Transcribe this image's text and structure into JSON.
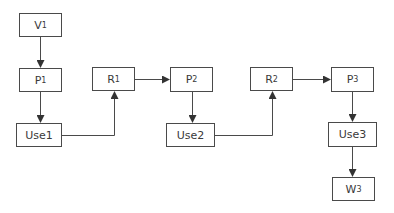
{
  "diagram": {
    "type": "flowchart",
    "colors": {
      "stroke": "#4a4a4a",
      "text": "#3a3a3a",
      "background": "#ffffff"
    },
    "nodes": [
      {
        "id": "V1",
        "base": "V",
        "sub": "1",
        "x": 19,
        "y": 13,
        "w": 43,
        "h": 24
      },
      {
        "id": "P1",
        "base": "P",
        "sub": "1",
        "x": 19,
        "y": 68,
        "w": 43,
        "h": 24
      },
      {
        "id": "Use1",
        "base": "Use1",
        "sub": "",
        "x": 16,
        "y": 123,
        "w": 46,
        "h": 24
      },
      {
        "id": "R1",
        "base": "R",
        "sub": "1",
        "x": 92,
        "y": 67,
        "w": 43,
        "h": 24
      },
      {
        "id": "P2",
        "base": "P",
        "sub": "2",
        "x": 170,
        "y": 67,
        "w": 43,
        "h": 25
      },
      {
        "id": "Use2",
        "base": "Use2",
        "sub": "",
        "x": 166,
        "y": 123,
        "w": 49,
        "h": 24
      },
      {
        "id": "R2",
        "base": "R",
        "sub": "2",
        "x": 250,
        "y": 67,
        "w": 43,
        "h": 24
      },
      {
        "id": "P3",
        "base": "P",
        "sub": "3",
        "x": 331,
        "y": 67,
        "w": 43,
        "h": 25
      },
      {
        "id": "Use3",
        "base": "Use3",
        "sub": "",
        "x": 328,
        "y": 122,
        "w": 49,
        "h": 25
      },
      {
        "id": "W3",
        "base": "W",
        "sub": "3",
        "x": 332,
        "y": 177,
        "w": 43,
        "h": 24
      }
    ],
    "edges": [
      {
        "from": "V1",
        "to": "P1"
      },
      {
        "from": "P1",
        "to": "Use1"
      },
      {
        "from": "Use1",
        "to": "R1"
      },
      {
        "from": "R1",
        "to": "P2"
      },
      {
        "from": "P2",
        "to": "Use2"
      },
      {
        "from": "Use2",
        "to": "R2"
      },
      {
        "from": "R2",
        "to": "P3"
      },
      {
        "from": "P3",
        "to": "Use3"
      },
      {
        "from": "Use3",
        "to": "W3"
      }
    ]
  }
}
